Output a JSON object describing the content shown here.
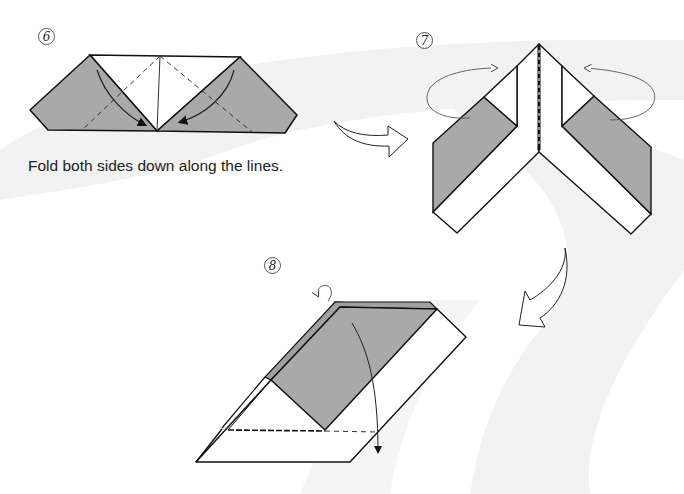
{
  "diagram": {
    "type": "origami-instructions",
    "colors": {
      "paper_colored": "#a9a9a9",
      "paper_white": "#ffffff",
      "line": "#111111",
      "background_swoosh": "#f1f1f1"
    },
    "steps": [
      {
        "number": "6",
        "caption": "Fold both sides down along the lines.",
        "description": "Trapezoid with two gray triangular flaps; dashed valley-fold lines and curved arrows pointing down to the center."
      },
      {
        "number": "7",
        "caption": "",
        "description": "Inverted V shape with gray panels; circular arrows indicating folding the sides behind."
      },
      {
        "number": "8",
        "caption": "",
        "description": "Parallelogram model with gray panel; dashed fold line and arrow indicating folding down; small arrow at top indicating fold behind."
      }
    ],
    "transition_arrows": [
      {
        "from": "6",
        "to": "7",
        "direction": "right"
      },
      {
        "from": "7",
        "to": "8",
        "direction": "down-left"
      }
    ]
  }
}
